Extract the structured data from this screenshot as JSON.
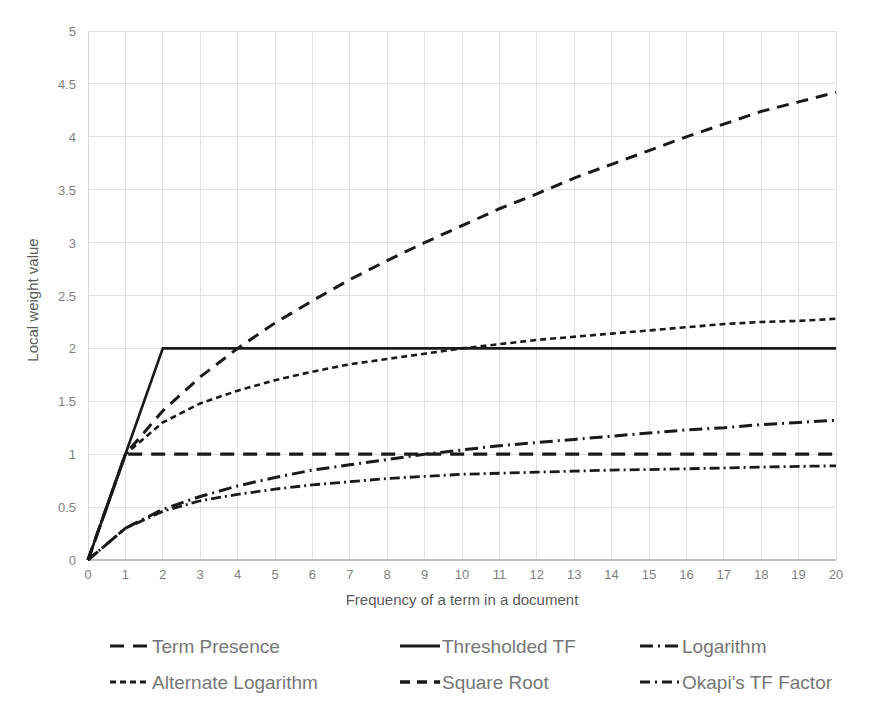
{
  "chart_data": {
    "type": "line",
    "title": "",
    "xlabel": "Frequency of a term in a document",
    "ylabel": "Local weight value",
    "xlim": [
      0,
      20
    ],
    "ylim": [
      0,
      5
    ],
    "grid": true,
    "legend_position": "bottom",
    "x_ticks": [
      "0",
      "1",
      "2",
      "3",
      "4",
      "5",
      "6",
      "7",
      "8",
      "9",
      "10",
      "11",
      "12",
      "13",
      "14",
      "15",
      "16",
      "17",
      "18",
      "19",
      "20"
    ],
    "y_ticks": [
      "0",
      "0.5",
      "1",
      "1.5",
      "2",
      "2.5",
      "3",
      "3.5",
      "4",
      "4.5",
      "5"
    ],
    "x": [
      0,
      1,
      2,
      3,
      4,
      5,
      6,
      7,
      8,
      9,
      10,
      11,
      12,
      13,
      14,
      15,
      16,
      17,
      18,
      19,
      20
    ],
    "series": [
      {
        "name": "Term Presence",
        "dash": "14 9",
        "width": 3.2,
        "values": [
          0,
          1,
          1,
          1,
          1,
          1,
          1,
          1,
          1,
          1,
          1,
          1,
          1,
          1,
          1,
          1,
          1,
          1,
          1,
          1,
          1
        ]
      },
      {
        "name": "Thresholded TF",
        "dash": "none",
        "width": 2.6,
        "values": [
          0,
          1,
          2,
          2,
          2,
          2,
          2,
          2,
          2,
          2,
          2,
          2,
          2,
          2,
          2,
          2,
          2,
          2,
          2,
          2,
          2
        ]
      },
      {
        "name": "Logarithm",
        "dash": "13 5 2 5",
        "width": 3.0,
        "values": [
          0,
          0.3,
          0.48,
          0.6,
          0.7,
          0.78,
          0.85,
          0.9,
          0.95,
          1.0,
          1.04,
          1.08,
          1.11,
          1.14,
          1.17,
          1.2,
          1.23,
          1.25,
          1.28,
          1.3,
          1.32
        ]
      },
      {
        "name": "Alternate Logarithm",
        "dash": "6 4",
        "width": 2.6,
        "values": [
          0,
          1,
          1.3,
          1.48,
          1.6,
          1.7,
          1.78,
          1.85,
          1.9,
          1.95,
          2.0,
          2.04,
          2.08,
          2.11,
          2.14,
          2.17,
          2.2,
          2.23,
          2.25,
          2.26,
          2.28
        ]
      },
      {
        "name": "Square Root",
        "dash": "12 8",
        "width": 3.0,
        "values": [
          0,
          1,
          1.41,
          1.73,
          2.0,
          2.24,
          2.45,
          2.65,
          2.83,
          3.0,
          3.16,
          3.32,
          3.46,
          3.61,
          3.74,
          3.87,
          4.0,
          4.12,
          4.24,
          4.33,
          4.42
        ]
      },
      {
        "name": "Okapi's TF Factor",
        "dash": "10 4 2 4",
        "width": 2.8,
        "values": [
          0,
          0.3,
          0.46,
          0.56,
          0.62,
          0.67,
          0.71,
          0.74,
          0.77,
          0.79,
          0.81,
          0.82,
          0.83,
          0.84,
          0.85,
          0.855,
          0.862,
          0.87,
          0.878,
          0.885,
          0.89
        ]
      }
    ],
    "legend": [
      {
        "label": "Term Presence",
        "dash": "14 9",
        "width": 3.2
      },
      {
        "label": "Thresholded TF",
        "dash": "none",
        "width": 3.0
      },
      {
        "label": "Logarithm",
        "dash": "13 5 2 5",
        "width": 3.2
      },
      {
        "label": "Alternate Logarithm",
        "dash": "6 4",
        "width": 3.2
      },
      {
        "label": "Square Root",
        "dash": "10 7",
        "width": 3.4
      },
      {
        "label": "Okapi's TF Factor",
        "dash": "10 5 2 5",
        "width": 3.2
      }
    ],
    "colors": {
      "line": "#1a1a1a",
      "grid": "#e2e2e2",
      "tick_text": "#7f7f7f",
      "axis_title": "#5a5a5a",
      "legend_text": "#767676",
      "background": "#ffffff"
    }
  }
}
